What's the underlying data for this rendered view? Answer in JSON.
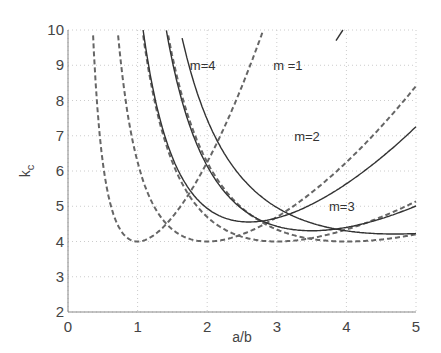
{
  "chart_data": {
    "type": "line",
    "title": "",
    "xlabel": "a/b",
    "ylabel": "k_c",
    "xlim": [
      0,
      5
    ],
    "ylim": [
      2,
      10
    ],
    "xticks": [
      0,
      1,
      2,
      3,
      4,
      5
    ],
    "yticks": [
      2,
      3,
      4,
      5,
      6,
      7,
      8,
      9,
      10
    ],
    "grid": true,
    "legend": null,
    "annotations": [
      {
        "text": "m=4",
        "x": 1.75,
        "y": 9.0
      },
      {
        "text": "m =1",
        "x": 2.95,
        "y": 9.0
      },
      {
        "text": "m=2",
        "x": 3.25,
        "y": 7.0
      },
      {
        "text": "m=3",
        "x": 3.75,
        "y": 5.0
      }
    ],
    "series": [
      {
        "name": "simply supported m=1",
        "style": "dashed",
        "x": [
          0.36,
          0.5,
          0.7,
          1.0,
          1.4,
          2.0,
          2.5,
          2.8
        ],
        "values": [
          10.0,
          6.25,
          4.62,
          4.0,
          4.36,
          6.25,
          8.41,
          9.97
        ]
      },
      {
        "name": "simply supported m=2",
        "style": "dashed",
        "x": [
          0.72,
          1.0,
          1.5,
          2.0,
          2.5,
          3.0,
          4.0,
          5.0
        ],
        "values": [
          10.0,
          6.25,
          4.34,
          4.0,
          4.1,
          4.69,
          6.25,
          8.41
        ]
      },
      {
        "name": "simply supported m=3",
        "style": "dashed",
        "x": [
          1.08,
          1.5,
          2.0,
          2.5,
          3.0,
          3.5,
          4.0,
          5.0
        ],
        "values": [
          10.0,
          6.25,
          4.69,
          4.14,
          4.0,
          4.05,
          4.17,
          4.62
        ]
      },
      {
        "name": "simply supported m=4",
        "style": "dashed",
        "x": [
          1.44,
          2.0,
          2.5,
          3.0,
          3.5,
          4.0,
          4.5,
          5.0
        ],
        "values": [
          10.0,
          6.25,
          5.06,
          4.34,
          4.13,
          4.0,
          4.01,
          4.1
        ]
      },
      {
        "name": "solid m=1",
        "style": "solid",
        "x": [
          3.85,
          3.95
        ],
        "values": [
          9.7,
          10.0
        ]
      },
      {
        "name": "solid curve 1",
        "style": "solid",
        "x": [
          1.04,
          1.5,
          2.0,
          2.6,
          3.0,
          3.5,
          4.0,
          4.5,
          5.0
        ],
        "values": [
          10.0,
          6.38,
          5.13,
          4.55,
          4.67,
          5.05,
          5.63,
          6.37,
          7.25
        ]
      },
      {
        "name": "solid curve 2",
        "style": "solid",
        "x": [
          1.34,
          2.0,
          2.5,
          3.0,
          3.5,
          4.0,
          4.5,
          5.0
        ],
        "values": [
          10.0,
          6.16,
          4.93,
          4.45,
          4.3,
          4.4,
          4.66,
          5.0
        ]
      },
      {
        "name": "solid curve 3",
        "style": "solid",
        "x": [
          1.64,
          2.0,
          2.5,
          3.0,
          3.5,
          4.0,
          4.5,
          5.0
        ],
        "values": [
          10.0,
          7.48,
          5.8,
          5.0,
          4.52,
          4.28,
          4.21,
          4.23
        ]
      }
    ]
  }
}
